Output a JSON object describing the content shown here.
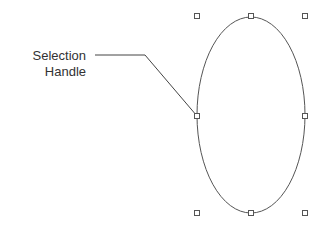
{
  "callout": {
    "line1": "Selection",
    "line2": "Handle"
  },
  "shape": {
    "type": "ellipse",
    "stroke": "#555555",
    "handle_color": "#555555"
  }
}
